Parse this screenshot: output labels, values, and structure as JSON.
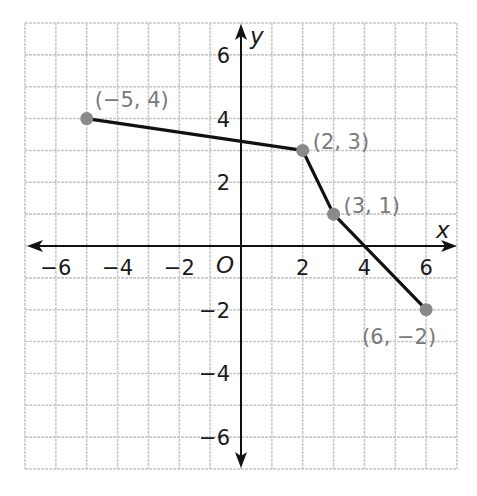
{
  "chart_data": {
    "type": "line",
    "title": "",
    "xlabel": "x",
    "ylabel": "y",
    "origin_label": "O",
    "xlim": [
      -7,
      7
    ],
    "ylim": [
      -7,
      7
    ],
    "grid": true,
    "x_ticks": [
      -6,
      -4,
      -2,
      2,
      4,
      6
    ],
    "y_ticks": [
      6,
      4,
      2,
      -2,
      -4,
      -6
    ],
    "x_tick_labels": [
      "−6",
      "−4",
      "−2",
      "2",
      "4",
      "6"
    ],
    "y_tick_labels": [
      "6",
      "4",
      "2",
      "−2",
      "−4",
      "−6"
    ],
    "series": [
      {
        "name": "piecewise",
        "points": [
          {
            "x": -5,
            "y": 4,
            "label": "(−5, 4)"
          },
          {
            "x": 2,
            "y": 3,
            "label": "(2, 3)"
          },
          {
            "x": 3,
            "y": 1,
            "label": "(3, 1)"
          },
          {
            "x": 6,
            "y": -2,
            "label": "(6, −2)"
          }
        ]
      }
    ],
    "colors": {
      "grid": "#c9c9c9",
      "axis": "#111111",
      "line": "#111111",
      "point": "#8a8a8a",
      "point_label": "#7a7a7a"
    }
  }
}
